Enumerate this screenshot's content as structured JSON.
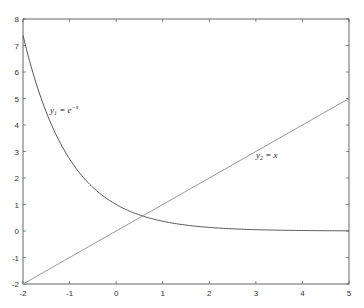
{
  "chart_data": {
    "type": "line",
    "title": "",
    "xlabel": "",
    "ylabel": "",
    "xlim": [
      -2,
      5
    ],
    "ylim": [
      -2,
      8
    ],
    "xticks": [
      -2,
      -1,
      0,
      1,
      2,
      3,
      4,
      5
    ],
    "yticks": [
      -2,
      -1,
      0,
      1,
      2,
      3,
      4,
      5,
      6,
      7,
      8
    ],
    "grid": false,
    "legend": null,
    "series": [
      {
        "name": "y1 = e^-x",
        "function": "exp(-x)",
        "x": [
          -2,
          -1.5,
          -1,
          -0.5,
          0,
          0.5,
          1,
          1.5,
          2,
          2.5,
          3,
          3.5,
          4,
          4.5,
          5
        ],
        "values": [
          7.389,
          4.482,
          2.718,
          1.649,
          1.0,
          0.607,
          0.368,
          0.223,
          0.135,
          0.082,
          0.05,
          0.03,
          0.018,
          0.011,
          0.007
        ],
        "color": "#555555"
      },
      {
        "name": "y2 = x",
        "function": "x",
        "x": [
          -2,
          5
        ],
        "values": [
          -2,
          5
        ],
        "color": "#999999"
      }
    ],
    "annotations": [
      {
        "text_main": "y",
        "sub": "1",
        "rest": " = e",
        "sup": "−x",
        "x": -0.95,
        "y": 4.7
      },
      {
        "text_main": "y",
        "sub": "2",
        "rest": " = x",
        "x": 3.3,
        "y": 2.3
      }
    ]
  },
  "axes": {
    "xtick_labels": [
      "-2",
      "-1",
      "0",
      "1",
      "2",
      "3",
      "4",
      "5"
    ],
    "ytick_labels": [
      "-2",
      "-1",
      "0",
      "1",
      "2",
      "3",
      "4",
      "5",
      "6",
      "7",
      "8"
    ]
  },
  "labels": {
    "y1_main": "y",
    "y1_sub": "1",
    "y1_rest": " = e",
    "y1_sup": "−x",
    "y2_main": "y",
    "y2_sub": "2",
    "y2_rest": " = x"
  }
}
